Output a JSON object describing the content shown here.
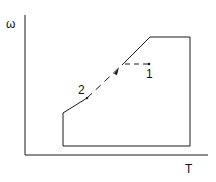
{
  "diagram": {
    "y_axis_label": "ω",
    "x_axis_label": "T",
    "point_1_label": "1",
    "point_2_label": "2",
    "line_color": "#1a1a1a"
  }
}
